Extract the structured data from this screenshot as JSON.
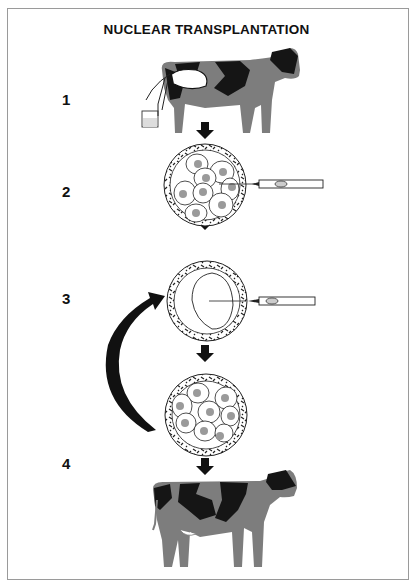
{
  "title": "NUCLEAR TRANSPLANTATION",
  "steps": [
    {
      "label": "1",
      "description": "donor cow"
    },
    {
      "label": "2",
      "description": "embryo cells extracted with micropipette"
    },
    {
      "label": "3",
      "description": "nucleus injected into enucleated egg"
    },
    {
      "label": "4",
      "description": "cloned calf / cow"
    }
  ],
  "colors": {
    "cow_body": "#7d7d7d",
    "cow_spots": "#151515",
    "cell_nucleus": "#9a9a9a",
    "arrow": "#111111",
    "frame": "#9a9a9a"
  }
}
